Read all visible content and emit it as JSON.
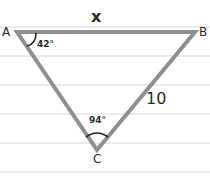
{
  "diagram": {
    "type": "triangle",
    "background": "lined paper",
    "line_color": "#d8d8d8",
    "edge_color": "#8f8f8f",
    "text_color": "#2a2a2a",
    "ruled_lines_y": [
      27,
      56,
      85,
      114,
      143,
      172
    ],
    "vertices": {
      "A": {
        "label": "A",
        "x": 17,
        "y": 32
      },
      "B": {
        "label": "B",
        "x": 195,
        "y": 32
      },
      "C": {
        "label": "C",
        "x": 97,
        "y": 150
      }
    },
    "angles": {
      "A": {
        "value": "42°"
      },
      "C": {
        "value": "94°"
      }
    },
    "sides": {
      "AB": {
        "label": "x"
      },
      "BC": {
        "label": "10"
      }
    }
  }
}
